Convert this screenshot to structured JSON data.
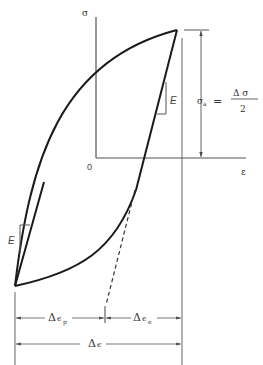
{
  "diagram": {
    "axes": {
      "y_label": "σ",
      "x_label": "ε",
      "origin_label": "0"
    },
    "moduli": [
      {
        "label": "E",
        "position": "upper-right branch"
      },
      {
        "label": "E",
        "position": "lower-left branch"
      }
    ],
    "amplitude": {
      "symbol": "σ",
      "subscript": "a",
      "equals": "=",
      "numerator": "Δ σ",
      "denominator": "2"
    },
    "dimensions": {
      "plastic": {
        "delta": "Δ",
        "symbol": "ϵ",
        "subscript": "p"
      },
      "elastic": {
        "delta": "Δ",
        "symbol": "ϵ",
        "subscript": "e"
      },
      "total": {
        "delta": "Δ",
        "symbol": "ϵ"
      }
    },
    "colors": {
      "loop": "#1a1a1a",
      "lines": "#555555"
    }
  }
}
